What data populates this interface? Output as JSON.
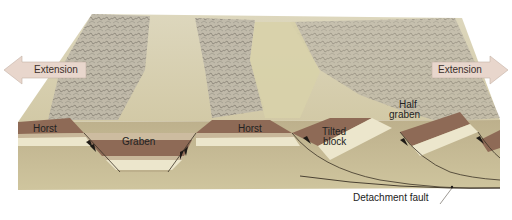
{
  "diagram": {
    "labels": {
      "extension_left": "Extension",
      "extension_right": "Extension",
      "horst_left": "Horst",
      "graben": "Graben",
      "horst_center": "Horst",
      "tilted_block_line1": "Tilted",
      "tilted_block_line2": "block",
      "half_graben_line1": "Half",
      "half_graben_line2": "graben",
      "detachment_fault": "Detachment fault"
    },
    "colors": {
      "background": "#ffffff",
      "surface_light": "#d9d2b4",
      "surface_valley": "#d6cfa6",
      "mountain_rock": "#b8b2a4",
      "mountain_dark": "#6e6a62",
      "layer_brown": "#8e6a56",
      "layer_cream": "#ece6cc",
      "layer_tan": "#c8b79a",
      "basement": "#bdb08c",
      "basement_dark": "#a89c78",
      "arrow_fill": "#e8d6cc",
      "fault_line": "#3b3226",
      "label_text": "#222222"
    }
  }
}
